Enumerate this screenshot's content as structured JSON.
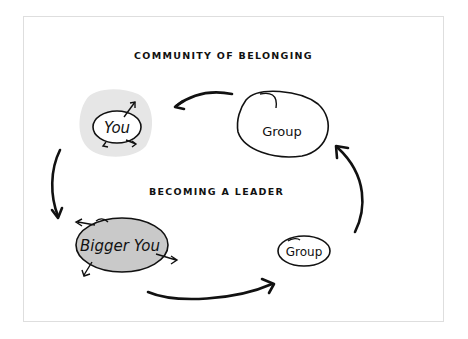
{
  "diagram": {
    "title_top": "COMMUNITY OF BELONGING",
    "title_middle": "BECOMING A LEADER",
    "nodes": {
      "you": {
        "label": "You",
        "fill": "#e6e6e6"
      },
      "group_top": {
        "label": "Group",
        "fill": "#ffffff"
      },
      "bigger_you": {
        "label": "Bigger You",
        "fill": "#c9c9c9"
      },
      "group_bottom": {
        "label": "Group",
        "fill": "#ffffff"
      }
    },
    "cycle": [
      "Group (top)",
      "You",
      "Bigger You",
      "Group (bottom)",
      "Group (top)"
    ],
    "colors": {
      "stroke": "#111111",
      "frame": "#dedede",
      "you_halo": "#e6e6e6",
      "bigger_you_fill": "#c9c9c9"
    }
  }
}
